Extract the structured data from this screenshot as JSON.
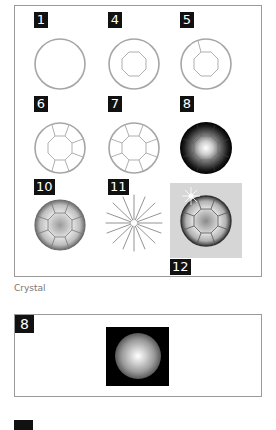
{
  "figure": {
    "steps": [
      {
        "label": "1",
        "description": "outer-circle"
      },
      {
        "label": "4",
        "description": "circle-with-octagon"
      },
      {
        "label": "5",
        "description": "circle-octagon-one-facet-line"
      },
      {
        "label": "6",
        "description": "partial-facets"
      },
      {
        "label": "7",
        "description": "all-facets"
      },
      {
        "label": "8",
        "description": "radial-gradient-fill"
      },
      {
        "label": "10",
        "description": "shaded-facets"
      },
      {
        "label": "11",
        "description": "sparkle-star"
      },
      {
        "label": "12",
        "description": "final-crystal-with-sparkle"
      }
    ],
    "caption": "Crystal"
  },
  "detail_figure": {
    "label": "8",
    "description": "radial-gradient-square"
  },
  "next_figure": {
    "label": ""
  },
  "colors": {
    "frame_border": "#9a9a9a",
    "label_bg": "#111111",
    "label_text": "#ffffff",
    "stroke": "#9c9c9c",
    "step12_bg": "#d6d6d6",
    "caption": "#777777"
  }
}
